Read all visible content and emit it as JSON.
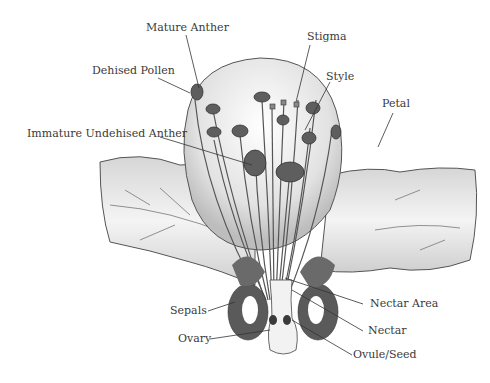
{
  "diagram": {
    "labels": {
      "mature_anther": "Mature Anther",
      "dehised_pollen": "Dehised Pollen",
      "immature_undehised_anther": "Immature Undehised Anther",
      "stigma": "Stigma",
      "style": "Style",
      "petal": "Petal",
      "sepals": "Sepals",
      "ovary": "Ovary",
      "nectar_area": "Nectar Area",
      "nectar": "Nectar",
      "ovule_seed": "Ovule/Seed"
    },
    "colors": {
      "line": "#333333",
      "petal_fill": "#e6e6e6",
      "petal_shade": "#c8c8c8",
      "anther": "#5e5e5e",
      "sepal": "#4a4a4a",
      "text": "#3a3a3a"
    }
  }
}
